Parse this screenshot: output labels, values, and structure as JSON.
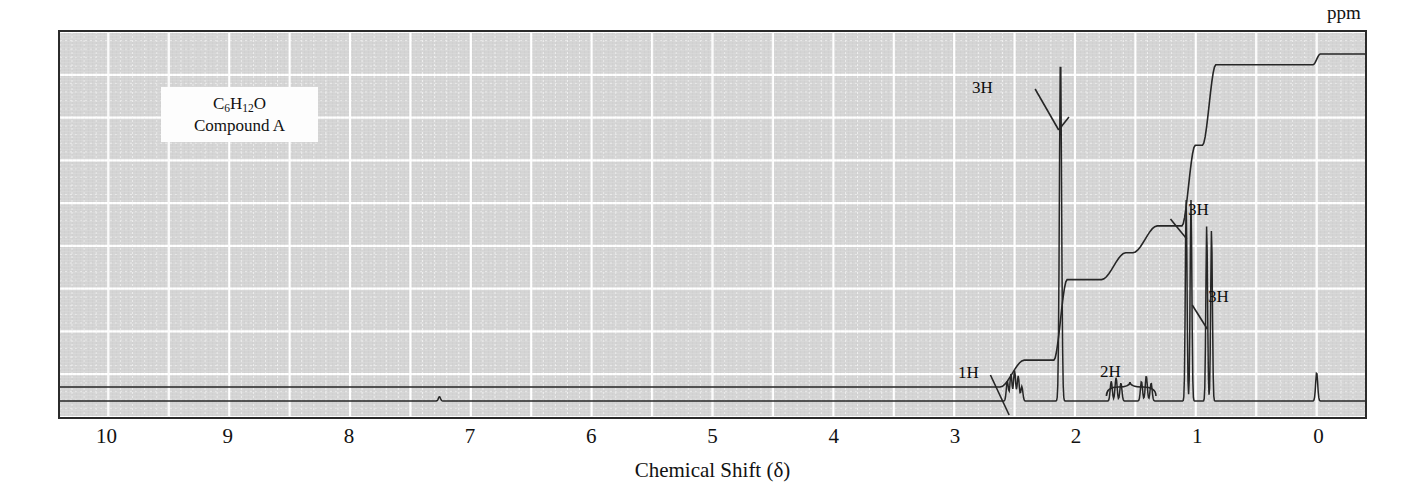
{
  "figure": {
    "type": "nmr-spectrum",
    "label_box": {
      "formula_main": "C",
      "formula_html_parts": [
        "C",
        "6",
        "H",
        "12",
        "O"
      ],
      "formula_text": "C6H12O",
      "compound_label": "Compound A"
    },
    "axis": {
      "title": "Chemical Shift (δ)",
      "unit_label": "ppm",
      "tick_labels": [
        "10",
        "9",
        "8",
        "7",
        "6",
        "5",
        "4",
        "3",
        "2",
        "1",
        "0"
      ],
      "tick_values": [
        10,
        9,
        8,
        7,
        6,
        5,
        4,
        3,
        2,
        1,
        0
      ],
      "range": [
        10.4,
        -0.4
      ],
      "direction": "reversed"
    },
    "annotations": [
      {
        "label": "1H",
        "shift": 2.52,
        "style": "leader-line"
      },
      {
        "label": "3H",
        "shift": 2.12,
        "style": "leader-line"
      },
      {
        "label": "2H",
        "shift": 1.55,
        "style": "brace"
      },
      {
        "label": "3H",
        "shift": 1.06,
        "style": "leader-line"
      },
      {
        "label": "3H",
        "shift": 0.89,
        "style": "leader-line"
      }
    ]
  },
  "chart_data": {
    "type": "line",
    "title": "",
    "subtitle": "",
    "xlabel": "Chemical Shift (δ)",
    "ylabel": "",
    "xlim": [
      10.4,
      -0.4
    ],
    "ylim": [
      0,
      1
    ],
    "grid": true,
    "legend": null,
    "x_tick_labels": [
      "10",
      "9",
      "8",
      "7",
      "6",
      "5",
      "4",
      "3",
      "2",
      "1",
      "0"
    ],
    "x_ticks": [
      10,
      9,
      8,
      7,
      6,
      5,
      4,
      3,
      2,
      1,
      0
    ],
    "series": [
      {
        "name": "spectrum",
        "peaks": [
          {
            "shift": 7.26,
            "height": 0.012,
            "multiplicity": "s",
            "assignment": "residual CHCl3"
          },
          {
            "shift": 2.56,
            "height": 0.055,
            "multiplicity": "m",
            "assignment": "1H"
          },
          {
            "shift": 2.53,
            "height": 0.075,
            "multiplicity": "m",
            "assignment": "1H"
          },
          {
            "shift": 2.5,
            "height": 0.085,
            "multiplicity": "m",
            "assignment": "1H"
          },
          {
            "shift": 2.47,
            "height": 0.07,
            "multiplicity": "m",
            "assignment": "1H"
          },
          {
            "shift": 2.44,
            "height": 0.04,
            "multiplicity": "m",
            "assignment": "1H"
          },
          {
            "shift": 2.12,
            "height": 0.965,
            "multiplicity": "s",
            "assignment": "3H (CH3 C=O)"
          },
          {
            "shift": 1.7,
            "height": 0.055,
            "multiplicity": "m",
            "assignment": "2H"
          },
          {
            "shift": 1.66,
            "height": 0.065,
            "multiplicity": "m",
            "assignment": "2H"
          },
          {
            "shift": 1.62,
            "height": 0.05,
            "multiplicity": "m",
            "assignment": "2H"
          },
          {
            "shift": 1.45,
            "height": 0.055,
            "multiplicity": "m",
            "assignment": "2H"
          },
          {
            "shift": 1.41,
            "height": 0.07,
            "multiplicity": "m",
            "assignment": "2H"
          },
          {
            "shift": 1.37,
            "height": 0.05,
            "multiplicity": "m",
            "assignment": "2H"
          },
          {
            "shift": 1.08,
            "height": 0.56,
            "multiplicity": "d",
            "assignment": "3H"
          },
          {
            "shift": 1.04,
            "height": 0.56,
            "multiplicity": "d",
            "assignment": "3H"
          },
          {
            "shift": 0.91,
            "height": 0.49,
            "multiplicity": "d",
            "assignment": "3H"
          },
          {
            "shift": 0.87,
            "height": 0.48,
            "multiplicity": "d",
            "assignment": "3H"
          },
          {
            "shift": 0.0,
            "height": 0.08,
            "multiplicity": "s",
            "assignment": "TMS"
          }
        ]
      },
      {
        "name": "integral",
        "type": "step-trace",
        "steps": [
          {
            "shift": 2.52,
            "rise": 1,
            "cumulative": 1
          },
          {
            "shift": 2.12,
            "rise": 3,
            "cumulative": 4
          },
          {
            "shift": 1.68,
            "rise": 1,
            "cumulative": 5
          },
          {
            "shift": 1.42,
            "rise": 1,
            "cumulative": 6
          },
          {
            "shift": 1.06,
            "rise": 3,
            "cumulative": 9
          },
          {
            "shift": 0.89,
            "rise": 3,
            "cumulative": 12
          },
          {
            "shift": 0.0,
            "rise": 0.4,
            "cumulative": 12.4
          }
        ],
        "total_protons": 12
      }
    ]
  },
  "colors": {
    "plot_background": "#d4d4d4",
    "grid_major": "#ffffff",
    "grid_minor": "#eeeeee",
    "trace": "#262626",
    "border": "#2b2b2b",
    "text": "#121212",
    "label_box_bg": "#fdfdfd"
  }
}
